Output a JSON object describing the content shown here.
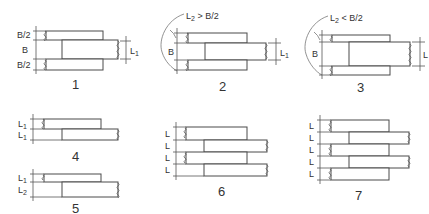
{
  "diagram": {
    "title": "",
    "figures": [
      {
        "id": "fig-1",
        "number": "1",
        "labels": {
          "top": "B/2",
          "mid": "B",
          "bot": "B/2",
          "right": "L1",
          "right_sub": "1"
        }
      },
      {
        "id": "fig-2",
        "number": "2",
        "condition": "L2 > B/2",
        "cond_main": "L",
        "cond_sub": "2",
        "cond_rest": " > B/2",
        "labels": {
          "mid": "B",
          "right": "L",
          "right_sub": "1"
        }
      },
      {
        "id": "fig-3",
        "number": "3",
        "condition": "L2 < B/2",
        "cond_main": "L",
        "cond_sub": "2",
        "cond_rest": " < B/2",
        "labels": {
          "mid": "B",
          "right": "L",
          "right_sub": "1"
        }
      },
      {
        "id": "fig-4",
        "number": "4",
        "labels": [
          "L1",
          "L1"
        ],
        "l_main": "L",
        "subs": [
          "1",
          "1"
        ]
      },
      {
        "id": "fig-5",
        "number": "5",
        "labels": [
          "L1",
          "L2"
        ],
        "l_main": "L",
        "subs": [
          "1",
          "2"
        ]
      },
      {
        "id": "fig-6",
        "number": "6",
        "labels": [
          "L",
          "L",
          "L",
          "L"
        ]
      },
      {
        "id": "fig-7",
        "number": "7",
        "labels": [
          "L",
          "L",
          "L",
          "L",
          "L"
        ]
      }
    ],
    "colors": {
      "line": "#4a4a4a",
      "background": "#ffffff"
    }
  }
}
